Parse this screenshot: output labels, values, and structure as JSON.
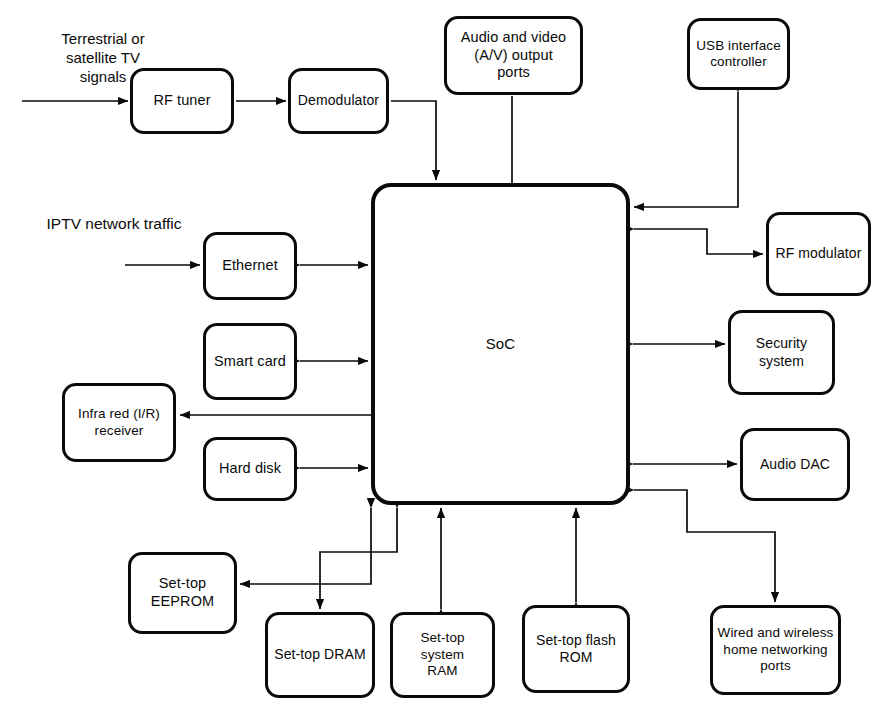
{
  "diagram": {
    "type": "block-diagram",
    "line_color": "#0a0a0a",
    "background_color": "#ffffff",
    "width": 882,
    "height": 718,
    "labels": [
      {
        "id": "input-terrestrial",
        "text": "Terrestrial or\nsatellite TV\nsignals",
        "x": 30,
        "y": 30,
        "width": 146,
        "font_size": 15
      },
      {
        "id": "input-iptv",
        "text": "IPTV network traffic",
        "x": 14,
        "y": 214,
        "width": 200,
        "font_size": 15.5
      }
    ],
    "nodes": [
      {
        "id": "rf-tuner",
        "name": "rf-tuner",
        "text": "RF  tuner",
        "x": 130,
        "y": 68,
        "w": 104,
        "h": 66,
        "font_size": 14.5
      },
      {
        "id": "demodulator",
        "name": "demodulator",
        "text": "Demodulator",
        "x": 288,
        "y": 68,
        "w": 101,
        "h": 66,
        "font_size": 14
      },
      {
        "id": "av-output-ports",
        "name": "audio-video-output-ports",
        "text": "Audio and  video\n(A/V)  output\nports",
        "x": 444,
        "y": 16,
        "w": 139,
        "h": 79,
        "font_size": 14.5
      },
      {
        "id": "usb-controller",
        "name": "usb-interface-controller",
        "text": "USB interface\ncontroller",
        "x": 687,
        "y": 18,
        "w": 103,
        "h": 72,
        "font_size": 13.5
      },
      {
        "id": "soc",
        "name": "soc",
        "text": "SoC",
        "x": 371,
        "y": 183,
        "w": 259,
        "h": 322,
        "font_size": 15,
        "border": 4
      },
      {
        "id": "ethernet",
        "name": "ethernet",
        "text": "Ethernet",
        "x": 203,
        "y": 232,
        "w": 94,
        "h": 68,
        "font_size": 14.5
      },
      {
        "id": "smart-card",
        "name": "smart-card",
        "text": "Smart  card",
        "x": 203,
        "y": 323,
        "w": 94,
        "h": 77,
        "font_size": 14.5
      },
      {
        "id": "ir-receiver",
        "name": "infra-red-receiver",
        "text": "Infra red (I/R)\nreceiver",
        "x": 62,
        "y": 383,
        "w": 114,
        "h": 79,
        "font_size": 13.5
      },
      {
        "id": "hard-disk",
        "name": "hard-disk",
        "text": "Hard  disk",
        "x": 203,
        "y": 437,
        "w": 94,
        "h": 64,
        "font_size": 14.5
      },
      {
        "id": "rf-modulator",
        "name": "rf-modulator",
        "text": "RF modulator",
        "x": 766,
        "y": 212,
        "w": 105,
        "h": 84,
        "font_size": 14
      },
      {
        "id": "security-system",
        "name": "security-system",
        "text": "Security\nsystem",
        "x": 728,
        "y": 310,
        "w": 107,
        "h": 85,
        "font_size": 14
      },
      {
        "id": "audio-dac",
        "name": "audio-dac",
        "text": "Audio DAC",
        "x": 740,
        "y": 428,
        "w": 110,
        "h": 73,
        "font_size": 14
      },
      {
        "id": "eeprom",
        "name": "set-top-eeprom",
        "text": "Set-top\nEEPROM",
        "x": 128,
        "y": 552,
        "w": 109,
        "h": 82,
        "font_size": 14.5
      },
      {
        "id": "dram",
        "name": "set-top-dram",
        "text": "Set-top  DRAM",
        "x": 265,
        "y": 612,
        "w": 110,
        "h": 86,
        "font_size": 14
      },
      {
        "id": "system-ram",
        "name": "set-top-system-ram",
        "text": "Set-top system\nRAM",
        "x": 390,
        "y": 612,
        "w": 105,
        "h": 86,
        "font_size": 13.5
      },
      {
        "id": "flash-rom",
        "name": "set-top-flash-rom",
        "text": "Set-top flash\nROM",
        "x": 522,
        "y": 605,
        "w": 108,
        "h": 88,
        "font_size": 14
      },
      {
        "id": "home-networking",
        "name": "home-networking-ports",
        "text": "Wired and  wireless\nhome networking\nports",
        "x": 710,
        "y": 605,
        "w": 131,
        "h": 90,
        "font_size": 13.5
      }
    ],
    "edges": [
      {
        "id": "e-tv-in",
        "from": "external-antenna",
        "to": "rf-tuner",
        "arrows": "end"
      },
      {
        "id": "e-tuner-demod",
        "from": "rf-tuner",
        "to": "demodulator",
        "arrows": "end"
      },
      {
        "id": "e-demod-soc",
        "from": "demodulator",
        "to": "soc",
        "arrows": "end"
      },
      {
        "id": "e-av-soc",
        "from": "av-output-ports",
        "to": "soc",
        "arrows": "none"
      },
      {
        "id": "e-usb-soc",
        "from": "usb-controller",
        "to": "soc",
        "arrows": "both"
      },
      {
        "id": "e-iptv-in",
        "from": "external-network",
        "to": "ethernet",
        "arrows": "end"
      },
      {
        "id": "e-ethernet-soc",
        "from": "ethernet",
        "to": "soc",
        "arrows": "both"
      },
      {
        "id": "e-smartcard-soc",
        "from": "smart-card",
        "to": "soc",
        "arrows": "both"
      },
      {
        "id": "e-soc-ir",
        "from": "soc",
        "to": "ir-receiver",
        "arrows": "end"
      },
      {
        "id": "e-harddisk-soc",
        "from": "hard-disk",
        "to": "soc",
        "arrows": "both"
      },
      {
        "id": "e-soc-rfmod",
        "from": "soc",
        "to": "rf-modulator",
        "arrows": "end"
      },
      {
        "id": "e-security-soc",
        "from": "security-system",
        "to": "soc",
        "arrows": "both"
      },
      {
        "id": "e-audiodac-soc",
        "from": "audio-dac",
        "to": "soc",
        "arrows": "both"
      },
      {
        "id": "e-soc-eeprom",
        "from": "soc",
        "to": "eeprom",
        "arrows": "end"
      },
      {
        "id": "e-soc-dram",
        "from": "soc",
        "to": "dram",
        "arrows": "both"
      },
      {
        "id": "e-systemram-soc",
        "from": "system-ram",
        "to": "soc",
        "arrows": "both"
      },
      {
        "id": "e-flashrom-soc",
        "from": "flash-rom",
        "to": "soc",
        "arrows": "both"
      },
      {
        "id": "e-soc-homenet",
        "from": "soc",
        "to": "home-networking",
        "arrows": "both"
      }
    ]
  }
}
